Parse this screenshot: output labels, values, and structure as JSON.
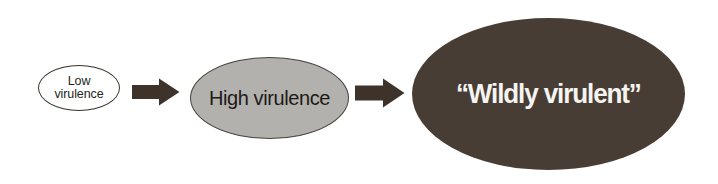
{
  "diagram": {
    "background_color": "#ffffff",
    "stages": [
      {
        "id": "low-virulence",
        "label": "Low\nvirulence",
        "shape": "ellipse",
        "fill_color": "#ffffff",
        "stroke_color": "#3a332c",
        "text_color": "#241f1a"
      },
      {
        "id": "high-virulence",
        "label": "High virulence",
        "shape": "ellipse",
        "fill_color": "#b2b1ad",
        "stroke_color": "#4a433c",
        "text_color": "#1d1a16"
      },
      {
        "id": "wildly-virulent",
        "label": "“Wildly virulent”",
        "shape": "ellipse",
        "fill_color": "#473d34",
        "stroke_color": "#473d34",
        "text_color": "#f6f4f0"
      }
    ],
    "connectors": [
      {
        "id": "arrow-1",
        "icon": "right-arrow-icon",
        "color": "#3d332a"
      },
      {
        "id": "arrow-2",
        "icon": "right-arrow-icon",
        "color": "#3d332a"
      }
    ]
  }
}
